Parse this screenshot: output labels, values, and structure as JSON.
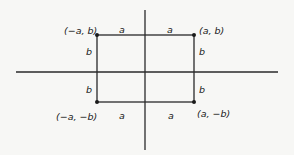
{
  "diagram": {
    "type": "coordinate-rectangle",
    "colors": {
      "background": "#f7f7f5",
      "line": "#2a2a2a",
      "text": "#1a1a1a"
    },
    "axes": {
      "horizontal": {
        "x1": 16,
        "x2": 278,
        "y": 72
      },
      "vertical": {
        "x": 145,
        "y1": 10,
        "y2": 150
      }
    },
    "rectangle": {
      "left": 97,
      "top": 35,
      "right": 194,
      "bottom": 102
    },
    "corners": [
      {
        "id": "top-left",
        "label": "(−a, b)",
        "x": 97,
        "y": 35
      },
      {
        "id": "top-right",
        "label": "(a, b)",
        "x": 194,
        "y": 35
      },
      {
        "id": "bottom-left",
        "label": "(−a, −b)",
        "x": 97,
        "y": 102
      },
      {
        "id": "bottom-right",
        "label": "(a, −b)",
        "x": 194,
        "y": 102
      }
    ],
    "side_labels": {
      "top_left_a": "a",
      "top_right_a": "a",
      "bottom_left_a": "a",
      "bottom_right_a": "a",
      "left_top_b": "b",
      "left_bottom_b": "b",
      "right_top_b": "b",
      "right_bottom_b": "b"
    }
  }
}
